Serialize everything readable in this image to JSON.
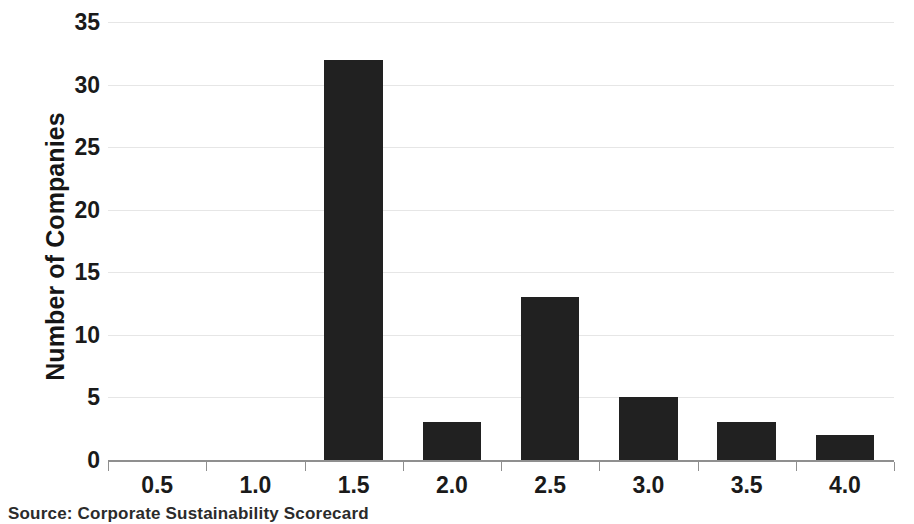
{
  "chart_data": {
    "type": "bar",
    "title": "",
    "subtitle": "",
    "xlabel": "",
    "ylabel": "Number of Companies",
    "categories": [
      "0.5",
      "1.0",
      "1.5",
      "2.0",
      "2.5",
      "3.0",
      "3.5",
      "4.0"
    ],
    "values": [
      0,
      0,
      32,
      3,
      13,
      5,
      3,
      2
    ],
    "series": [
      {
        "name": "Number of Companies",
        "values": [
          0,
          0,
          32,
          3,
          13,
          5,
          3,
          2
        ]
      }
    ],
    "ylim": [
      0,
      35
    ],
    "ytick_labels": [
      "0",
      "5",
      "10",
      "15",
      "20",
      "25",
      "30",
      "35"
    ],
    "ytick_values": [
      0,
      5,
      10,
      15,
      20,
      25,
      30,
      35
    ],
    "xtick_labels": [
      "0.5",
      "1.0",
      "1.5",
      "2.0",
      "2.5",
      "3.0",
      "3.5",
      "4.0"
    ],
    "grid": true,
    "grid_axis": "y",
    "legend": false,
    "legend_position": "none",
    "bar_color": "#212121",
    "gridline_color": "#e6e6e6",
    "axis_color": "#8f8f8f",
    "text_color": "#1a1a1a",
    "background_color": "#ffffff",
    "annotations": []
  },
  "caption": {
    "source_text": "Source: Corporate Sustainability Scorecard"
  }
}
